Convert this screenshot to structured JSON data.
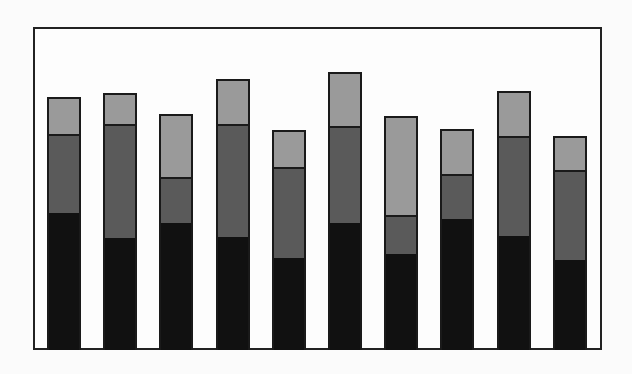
{
  "chart_data": {
    "type": "bar",
    "stacked": true,
    "title": "",
    "xlabel": "",
    "ylabel": "",
    "categories": [
      "1",
      "2",
      "3",
      "4",
      "5",
      "6",
      "7",
      "8",
      "9",
      "10"
    ],
    "series": [
      {
        "name": "bottom (black)",
        "color": "#111111",
        "values": [
          138,
          113,
          128,
          114,
          93,
          128,
          97,
          132,
          115,
          91
        ]
      },
      {
        "name": "middle (dark gray)",
        "color": "#5a5a5a",
        "values": [
          78,
          113,
          44,
          112,
          90,
          96,
          37,
          44,
          99,
          89
        ]
      },
      {
        "name": "top (light gray)",
        "color": "#9a9a9a",
        "values": [
          37,
          31,
          64,
          45,
          37,
          54,
          100,
          45,
          45,
          34
        ]
      }
    ],
    "ylim": [
      0,
      323
    ],
    "grid": false,
    "legend": "none",
    "axis_ticks": "none"
  }
}
